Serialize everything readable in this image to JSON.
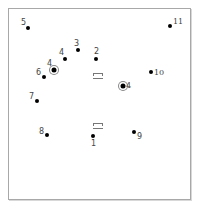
{
  "diagram": {
    "points": [
      {
        "id": "5",
        "label": "5",
        "x": 28,
        "y": 28,
        "lx": 21,
        "ly": 19,
        "marker": "dot"
      },
      {
        "id": "11",
        "label": "11",
        "x": 170,
        "y": 26,
        "lx": 173,
        "ly": 18,
        "marker": "dot",
        "serif": true
      },
      {
        "id": "3",
        "label": "3",
        "x": 78,
        "y": 50,
        "lx": 74,
        "ly": 40,
        "marker": "dot"
      },
      {
        "id": "4a",
        "label": "4",
        "x": 65,
        "y": 59,
        "lx": 59,
        "ly": 49,
        "marker": "dot"
      },
      {
        "id": "2",
        "label": "2",
        "x": 96,
        "y": 59,
        "lx": 94,
        "ly": 48,
        "marker": "dot"
      },
      {
        "id": "4b",
        "label": "4",
        "x": 54,
        "y": 70,
        "lx": 47,
        "ly": 60,
        "marker": "ring"
      },
      {
        "id": "6",
        "label": "6",
        "x": 44,
        "y": 77,
        "lx": 36,
        "ly": 69,
        "marker": "dot"
      },
      {
        "id": "10",
        "label": "10",
        "x": 151,
        "y": 72,
        "lx": 154,
        "ly": 69,
        "marker": "dot",
        "serif": true
      },
      {
        "id": "4c",
        "label": "4",
        "x": 123,
        "y": 86,
        "lx": 126,
        "ly": 82,
        "marker": "ring",
        "serif": true
      },
      {
        "id": "7",
        "label": "7",
        "x": 37,
        "y": 101,
        "lx": 29,
        "ly": 93,
        "marker": "dot"
      },
      {
        "id": "8",
        "label": "8",
        "x": 47,
        "y": 135,
        "lx": 39,
        "ly": 128,
        "marker": "dot"
      },
      {
        "id": "9",
        "label": "9",
        "x": 134,
        "y": 132,
        "lx": 137,
        "ly": 133,
        "marker": "dot"
      },
      {
        "id": "1",
        "label": "1",
        "x": 93,
        "y": 136,
        "lx": 91,
        "ly": 140,
        "marker": "dot"
      }
    ],
    "symbols": [
      {
        "id": "bracket-upper",
        "x": 93,
        "y": 73
      },
      {
        "id": "bracket-lower",
        "x": 93,
        "y": 123
      }
    ]
  }
}
